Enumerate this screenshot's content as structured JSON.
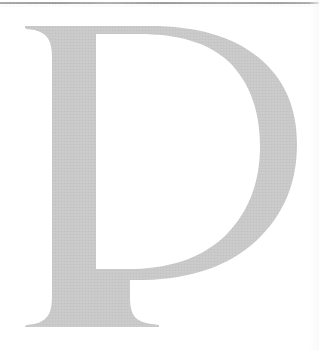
{
  "page": {
    "kind": "scanned-book-page",
    "width": 319,
    "height": 350,
    "background_color": "#ffffff"
  },
  "rule": {
    "name": "horizontal-rule",
    "color": "#919191",
    "thickness_px": 2,
    "top_px": 2
  },
  "dropcap": {
    "letter": "D",
    "style": "serif-transitional",
    "fill_color": "#c3c3c3",
    "cap_top_px": 26,
    "baseline_px": 327,
    "left_px": 25,
    "right_px": 296
  }
}
